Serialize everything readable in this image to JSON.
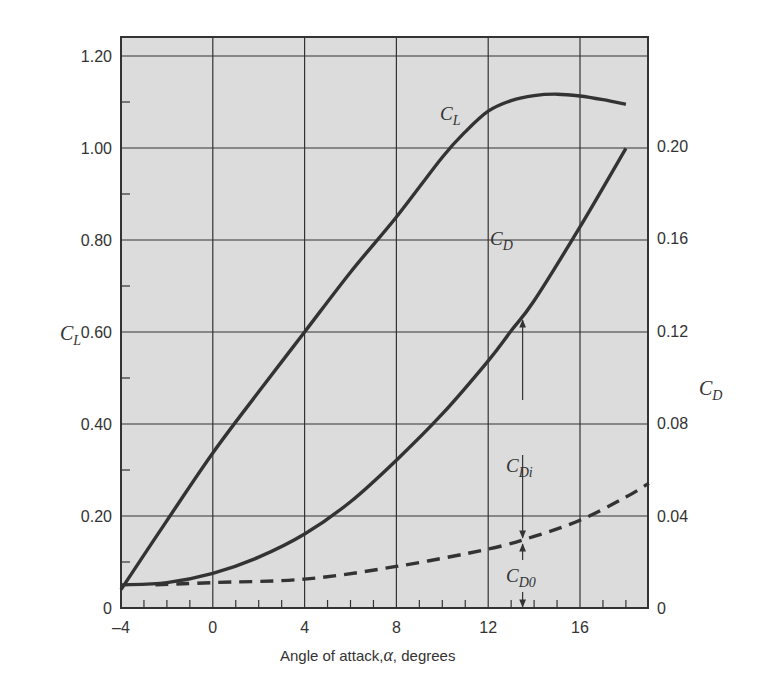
{
  "chart_data": {
    "type": "line",
    "title": "",
    "xlabel": "Angle of attack, α , degrees",
    "xlabel_parts": {
      "pre": "Angle of attack,",
      "symbol": "α",
      "post": ", degrees"
    },
    "ylabel_left": {
      "main": "C",
      "sub": "L"
    },
    "ylabel_right": {
      "main": "C",
      "sub": "D"
    },
    "xlim": [
      -4,
      19
    ],
    "ylim_left": [
      0,
      1.24
    ],
    "ylim_right": [
      0,
      0.248
    ],
    "x_ticks": [
      -4,
      0,
      4,
      8,
      12,
      16
    ],
    "x_tick_labels": [
      "–4",
      "0",
      "4",
      "8",
      "12",
      "16"
    ],
    "y_left_ticks": [
      0,
      0.2,
      0.4,
      0.6,
      0.8,
      1.0,
      1.2
    ],
    "y_left_tick_labels": [
      "0",
      "0.20",
      "0.40",
      "0.60",
      "0.80",
      "1.00",
      "1.20"
    ],
    "y_right_ticks": [
      0,
      0.04,
      0.08,
      0.12,
      0.16,
      0.2
    ],
    "y_right_tick_labels": [
      "0",
      "0.04",
      "0.08",
      "0.12",
      "0.16",
      "0.20"
    ],
    "grid": true,
    "background": "#dcdcdc",
    "line_color": "#333333",
    "series": [
      {
        "name": "C_L",
        "axis": "left",
        "style": "solid",
        "x": [
          -4,
          -2,
          0,
          2,
          4,
          6,
          8,
          10,
          11,
          12,
          13,
          14,
          15,
          16,
          17,
          18
        ],
        "values": [
          0.04,
          0.19,
          0.337,
          0.47,
          0.6,
          0.73,
          0.85,
          0.98,
          1.035,
          1.08,
          1.103,
          1.114,
          1.117,
          1.113,
          1.105,
          1.095
        ]
      },
      {
        "name": "C_D",
        "axis": "right",
        "style": "solid",
        "x": [
          -4,
          -2,
          0,
          2,
          4,
          6,
          8,
          10,
          12,
          13,
          14,
          16,
          18
        ],
        "values": [
          0.01,
          0.011,
          0.015,
          0.022,
          0.032,
          0.046,
          0.064,
          0.084,
          0.107,
          0.12,
          0.133,
          0.165,
          0.199
        ]
      },
      {
        "name": "C_D0",
        "axis": "right",
        "style": "dashed",
        "x": [
          -2.5,
          0,
          4,
          8,
          12,
          14,
          16,
          18,
          19
        ],
        "values": [
          0.01,
          0.011,
          0.0125,
          0.018,
          0.0255,
          0.031,
          0.038,
          0.048,
          0.054
        ]
      }
    ],
    "annotations": [
      {
        "text_main": "C",
        "text_sub": "L",
        "x": 11.2,
        "y_left": 1.105
      },
      {
        "text_main": "C",
        "text_sub": "D",
        "x": 13.3,
        "y_left": 0.74
      },
      {
        "text_main": "C",
        "text_sub": "Di",
        "x": 13.4,
        "y_left": 0.36,
        "note": "double arrow between C_D0 and C_D at α≈13.5"
      },
      {
        "text_main": "C",
        "text_sub": "D0",
        "x": 13.4,
        "y_left": 0.075,
        "note": "double arrow between axis and C_D0 at α≈13.5"
      }
    ],
    "arrow_x": 13.5
  }
}
